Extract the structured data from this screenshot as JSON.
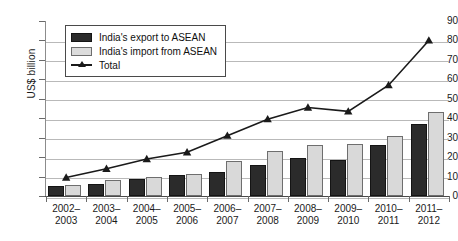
{
  "chart_data": {
    "type": "bar",
    "title": "",
    "xlabel": "",
    "ylabel": "US$ billion",
    "ylim": [
      0,
      90
    ],
    "ytick_step": 10,
    "grid": true,
    "legend_position": "top-left",
    "categories": [
      "2002-2003",
      "2003-2004",
      "2004-2005",
      "2005-2006",
      "2006-2007",
      "2007-2008",
      "2008-2009",
      "2009-2010",
      "2010-2011",
      "2011-2012"
    ],
    "category_lines": [
      [
        "2002–",
        "2003"
      ],
      [
        "2003–",
        "2004"
      ],
      [
        "2004–",
        "2005"
      ],
      [
        "2005–",
        "2006"
      ],
      [
        "2006–",
        "2007"
      ],
      [
        "2007–",
        "2008"
      ],
      [
        "2008–",
        "2009"
      ],
      [
        "2009–",
        "2010"
      ],
      [
        "2010–",
        "2011"
      ],
      [
        "2011–",
        "2012"
      ]
    ],
    "ytick_labels": [
      "0",
      "10",
      "20",
      "30",
      "40",
      "50",
      "60",
      "70",
      "80",
      "90"
    ],
    "series": [
      {
        "name": "India's export to ASEAN",
        "kind": "bar",
        "color": "#2b2b2b",
        "values": [
          5,
          6,
          9,
          11,
          12.5,
          16,
          19.5,
          18.5,
          26,
          37
        ]
      },
      {
        "name": "India's import from ASEAN",
        "kind": "bar",
        "color": "#d9d9d9",
        "values": [
          5.5,
          8,
          9.8,
          11.5,
          18,
          23,
          26,
          26.5,
          31,
          43
        ]
      },
      {
        "name": "Total",
        "kind": "line",
        "color": "#1a1a1a",
        "marker": "triangle",
        "values": [
          9.5,
          14,
          19,
          22.5,
          31,
          39.5,
          45.5,
          43.5,
          57,
          80
        ]
      }
    ]
  },
  "legend": {
    "items": [
      {
        "label": "India's export to ASEAN",
        "swatch": "dark"
      },
      {
        "label": "India's import from ASEAN",
        "swatch": "light"
      },
      {
        "label": "Total",
        "swatch": "line"
      }
    ]
  }
}
